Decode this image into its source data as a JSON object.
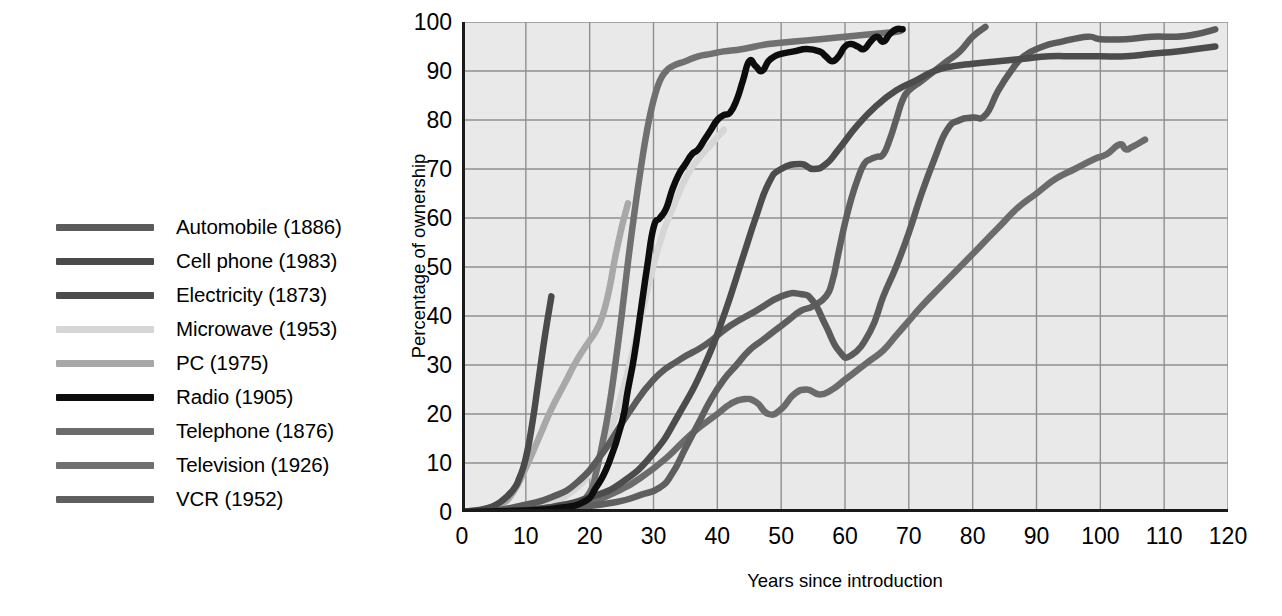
{
  "chart_data": {
    "type": "line",
    "title": "",
    "xlabel": "Years since introduction",
    "ylabel": "Percentage of ownership",
    "xlim": [
      0,
      120
    ],
    "ylim": [
      0,
      100
    ],
    "xticks": [
      0,
      10,
      20,
      30,
      40,
      50,
      60,
      70,
      80,
      90,
      100,
      110,
      120
    ],
    "yticks": [
      0,
      10,
      20,
      30,
      40,
      50,
      60,
      70,
      80,
      90,
      100
    ],
    "grid": true,
    "legend_position": "left-outside",
    "plot_background": "#e9e9e9",
    "grid_color": "#8f8f8f",
    "axis_color": "#1a1a1a",
    "series": [
      {
        "name": "Automobile (1886)",
        "label": "Automobile (1886)",
        "introduced": 1886,
        "color": "#5b5b5b",
        "width": 6.5,
        "points": [
          [
            0,
            0
          ],
          [
            5,
            0.3
          ],
          [
            10,
            1.5
          ],
          [
            14,
            3
          ],
          [
            18,
            6
          ],
          [
            22,
            12
          ],
          [
            26,
            20
          ],
          [
            30,
            27
          ],
          [
            34,
            31
          ],
          [
            38,
            34
          ],
          [
            42,
            38
          ],
          [
            46,
            41
          ],
          [
            50,
            44
          ],
          [
            53,
            44.5
          ],
          [
            55,
            43
          ],
          [
            57,
            38
          ],
          [
            59,
            33
          ],
          [
            61,
            32
          ],
          [
            64,
            37
          ],
          [
            66,
            44
          ],
          [
            68,
            50
          ],
          [
            70,
            57
          ],
          [
            72,
            65
          ],
          [
            74,
            72
          ],
          [
            76,
            78
          ],
          [
            78,
            80
          ],
          [
            80,
            80.5
          ],
          [
            82,
            81
          ],
          [
            84,
            86
          ],
          [
            86,
            90
          ],
          [
            88,
            93
          ],
          [
            91,
            95
          ],
          [
            94,
            96
          ],
          [
            98,
            97
          ],
          [
            100,
            96.5
          ],
          [
            104,
            96.5
          ],
          [
            108,
            97
          ],
          [
            112,
            97
          ],
          [
            115,
            97.5
          ],
          [
            118,
            98.5
          ]
        ]
      },
      {
        "name": "Cell phone (1983)",
        "label": "Cell phone (1983)",
        "introduced": 1983,
        "color": "#4a4a4a",
        "width": 6.5,
        "points": [
          [
            0,
            0
          ],
          [
            2,
            0.3
          ],
          [
            4,
            0.8
          ],
          [
            6,
            2
          ],
          [
            8,
            4.5
          ],
          [
            9,
            7
          ],
          [
            10,
            11
          ],
          [
            11,
            18
          ],
          [
            12,
            27
          ],
          [
            13,
            36
          ],
          [
            14,
            44
          ]
        ]
      },
      {
        "name": "Electricity (1873)",
        "label": "Electricity (1873)",
        "introduced": 1873,
        "color": "#4c4c4c",
        "width": 6.5,
        "points": [
          [
            0,
            0
          ],
          [
            8,
            0.3
          ],
          [
            14,
            1
          ],
          [
            20,
            3
          ],
          [
            25,
            6
          ],
          [
            30,
            12
          ],
          [
            34,
            20
          ],
          [
            38,
            30
          ],
          [
            41,
            40
          ],
          [
            44,
            52
          ],
          [
            46,
            60
          ],
          [
            48,
            67
          ],
          [
            50,
            70
          ],
          [
            53,
            71
          ],
          [
            55,
            70
          ],
          [
            57,
            71
          ],
          [
            59,
            74
          ],
          [
            62,
            79
          ],
          [
            65,
            83
          ],
          [
            68,
            86
          ],
          [
            71,
            88
          ],
          [
            74,
            90
          ],
          [
            77,
            91
          ],
          [
            80,
            91.5
          ],
          [
            84,
            92
          ],
          [
            88,
            92.5
          ],
          [
            92,
            93
          ],
          [
            96,
            93
          ],
          [
            100,
            93
          ],
          [
            104,
            93
          ],
          [
            108,
            93.5
          ],
          [
            112,
            94
          ],
          [
            115,
            94.5
          ],
          [
            118,
            95
          ]
        ]
      },
      {
        "name": "Microwave (1953)",
        "label": "Microwave (1953)",
        "introduced": 1953,
        "color": "#d6d6d6",
        "width": 6.5,
        "points": [
          [
            0,
            0
          ],
          [
            5,
            0.3
          ],
          [
            10,
            1
          ],
          [
            14,
            2
          ],
          [
            17,
            4
          ],
          [
            20,
            8
          ],
          [
            23,
            16
          ],
          [
            25,
            24
          ],
          [
            27,
            34
          ],
          [
            29,
            45
          ],
          [
            31,
            55
          ],
          [
            33,
            62
          ],
          [
            35,
            68
          ],
          [
            37,
            72
          ],
          [
            39,
            75
          ],
          [
            41,
            78
          ]
        ]
      },
      {
        "name": "PC (1975)",
        "label": "PC (1975)",
        "introduced": 1975,
        "color": "#a8a8a8",
        "width": 6.5,
        "points": [
          [
            0,
            0
          ],
          [
            3,
            0.3
          ],
          [
            6,
            1.5
          ],
          [
            8,
            4
          ],
          [
            10,
            9
          ],
          [
            12,
            15
          ],
          [
            14,
            21
          ],
          [
            16,
            26
          ],
          [
            18,
            31
          ],
          [
            20,
            35
          ],
          [
            21,
            37
          ],
          [
            22,
            40
          ],
          [
            23,
            45
          ],
          [
            24,
            52
          ],
          [
            25,
            58
          ],
          [
            26,
            63
          ]
        ]
      },
      {
        "name": "Radio (1905)",
        "label": "Radio (1905)",
        "introduced": 1905,
        "color": "#0d0d0d",
        "width": 6.5,
        "points": [
          [
            0,
            0
          ],
          [
            10,
            0.3
          ],
          [
            15,
            0.8
          ],
          [
            19,
            2
          ],
          [
            21,
            5
          ],
          [
            23,
            10
          ],
          [
            25,
            18
          ],
          [
            26,
            25
          ],
          [
            27,
            32
          ],
          [
            28,
            41
          ],
          [
            29,
            50
          ],
          [
            30,
            58
          ],
          [
            31,
            60
          ],
          [
            32,
            62
          ],
          [
            33,
            66
          ],
          [
            34,
            69
          ],
          [
            35,
            71
          ],
          [
            36,
            73
          ],
          [
            37,
            74
          ],
          [
            38,
            76
          ],
          [
            39,
            78
          ],
          [
            40,
            80
          ],
          [
            41,
            81
          ],
          [
            42,
            81.5
          ],
          [
            43,
            84
          ],
          [
            44,
            88
          ],
          [
            45,
            92
          ],
          [
            46,
            91
          ],
          [
            47,
            90
          ],
          [
            48,
            92
          ],
          [
            49,
            93
          ],
          [
            50,
            93.5
          ],
          [
            52,
            94
          ],
          [
            54,
            94.5
          ],
          [
            56,
            94
          ],
          [
            57,
            93
          ],
          [
            58,
            92
          ],
          [
            59,
            93
          ],
          [
            60,
            95
          ],
          [
            61,
            95.5
          ],
          [
            62,
            95
          ],
          [
            63,
            94.5
          ],
          [
            64,
            96
          ],
          [
            65,
            97
          ],
          [
            66,
            96
          ],
          [
            67,
            97.5
          ],
          [
            68,
            98.5
          ],
          [
            69,
            98.5
          ]
        ]
      },
      {
        "name": "Telephone (1876)",
        "label": "Telephone (1876)",
        "introduced": 1876,
        "color": "#6b6b6b",
        "width": 6.5,
        "points": [
          [
            0,
            0
          ],
          [
            10,
            0.3
          ],
          [
            16,
            1
          ],
          [
            20,
            2
          ],
          [
            24,
            4
          ],
          [
            28,
            7
          ],
          [
            32,
            11
          ],
          [
            36,
            16
          ],
          [
            40,
            20
          ],
          [
            42,
            22
          ],
          [
            44,
            23
          ],
          [
            46,
            22.5
          ],
          [
            48,
            20
          ],
          [
            50,
            21
          ],
          [
            52,
            24
          ],
          [
            54,
            25
          ],
          [
            56,
            24
          ],
          [
            58,
            25
          ],
          [
            60,
            27
          ],
          [
            62,
            29
          ],
          [
            64,
            31
          ],
          [
            66,
            33
          ],
          [
            68,
            36
          ],
          [
            70,
            39
          ],
          [
            72,
            42
          ],
          [
            75,
            46
          ],
          [
            78,
            50
          ],
          [
            81,
            54
          ],
          [
            84,
            58
          ],
          [
            87,
            62
          ],
          [
            90,
            65
          ],
          [
            93,
            68
          ],
          [
            96,
            70
          ],
          [
            99,
            72
          ],
          [
            101,
            73
          ],
          [
            103,
            75
          ],
          [
            104,
            74
          ],
          [
            105,
            74.5
          ],
          [
            107,
            76
          ]
        ]
      },
      {
        "name": "Television (1926)",
        "label": "Television (1926)",
        "introduced": 1926,
        "color": "#707070",
        "width": 6.5,
        "points": [
          [
            0,
            0
          ],
          [
            8,
            0.3
          ],
          [
            14,
            1
          ],
          [
            18,
            2
          ],
          [
            20,
            4
          ],
          [
            21,
            8
          ],
          [
            22,
            14
          ],
          [
            23,
            21
          ],
          [
            24,
            30
          ],
          [
            25,
            40
          ],
          [
            26,
            51
          ],
          [
            27,
            61
          ],
          [
            28,
            70
          ],
          [
            29,
            78
          ],
          [
            30,
            84
          ],
          [
            31,
            88
          ],
          [
            32,
            90
          ],
          [
            33,
            91
          ],
          [
            35,
            92
          ],
          [
            37,
            93
          ],
          [
            39,
            93.5
          ],
          [
            41,
            94
          ],
          [
            44,
            94.5
          ],
          [
            48,
            95.5
          ],
          [
            52,
            96
          ],
          [
            56,
            96.5
          ],
          [
            60,
            97
          ],
          [
            64,
            97.5
          ],
          [
            68,
            98
          ],
          [
            69,
            98.5
          ]
        ]
      },
      {
        "name": "VCR (1952)",
        "label": "VCR (1952)",
        "introduced": 1952,
        "color": "#5f5f5f",
        "width": 6.5,
        "points": [
          [
            0,
            0
          ],
          [
            10,
            0.3
          ],
          [
            18,
            1
          ],
          [
            24,
            2
          ],
          [
            28,
            3.5
          ],
          [
            31,
            5
          ],
          [
            33,
            8
          ],
          [
            35,
            13
          ],
          [
            37,
            18
          ],
          [
            39,
            23
          ],
          [
            41,
            27
          ],
          [
            43,
            30
          ],
          [
            45,
            33
          ],
          [
            47,
            35
          ],
          [
            49,
            37
          ],
          [
            51,
            39
          ],
          [
            53,
            41
          ],
          [
            55,
            42
          ],
          [
            57,
            44
          ],
          [
            58,
            47
          ],
          [
            59,
            53
          ],
          [
            60,
            59
          ],
          [
            61,
            64
          ],
          [
            62,
            68
          ],
          [
            63,
            71
          ],
          [
            64,
            72
          ],
          [
            65,
            72.5
          ],
          [
            66,
            73
          ],
          [
            67,
            76
          ],
          [
            68,
            80
          ],
          [
            69,
            84
          ],
          [
            70,
            86
          ],
          [
            72,
            88
          ],
          [
            74,
            90
          ],
          [
            76,
            92
          ],
          [
            78,
            94
          ],
          [
            80,
            97
          ],
          [
            82,
            99
          ]
        ]
      }
    ]
  },
  "legend": {
    "items": [
      {
        "label": "Automobile (1886)",
        "color": "#5b5b5b"
      },
      {
        "label": "Cell phone (1983)",
        "color": "#4a4a4a"
      },
      {
        "label": "Electricity (1873)",
        "color": "#4c4c4c"
      },
      {
        "label": "Microwave (1953)",
        "color": "#d6d6d6"
      },
      {
        "label": "PC (1975)",
        "color": "#a8a8a8"
      },
      {
        "label": "Radio (1905)",
        "color": "#0d0d0d"
      },
      {
        "label": "Telephone (1876)",
        "color": "#6b6b6b"
      },
      {
        "label": "Television (1926)",
        "color": "#707070"
      },
      {
        "label": "VCR (1952)",
        "color": "#5f5f5f"
      }
    ]
  },
  "axes": {
    "x_label": "Years since introduction",
    "y_label": "Percentage of ownership",
    "x_ticks": [
      "0",
      "10",
      "20",
      "30",
      "40",
      "50",
      "60",
      "70",
      "80",
      "90",
      "100",
      "110",
      "120"
    ],
    "y_ticks": [
      "0",
      "10",
      "20",
      "30",
      "40",
      "50",
      "60",
      "70",
      "80",
      "90",
      "100"
    ]
  }
}
